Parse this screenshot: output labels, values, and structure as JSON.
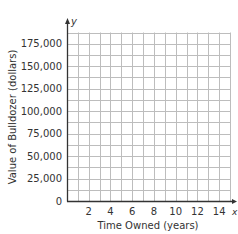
{
  "chart_data": {
    "type": "line",
    "title": "",
    "xlabel": "Time Owned (years)",
    "ylabel": "Value of Bulldozer (dollars)",
    "x_axis_var": "x",
    "y_axis_var": "y",
    "xlim": [
      0,
      15
    ],
    "ylim": [
      0,
      187500
    ],
    "x_ticks": [
      2,
      4,
      6,
      8,
      10,
      12,
      14
    ],
    "x_tick_labels": [
      "2",
      "4",
      "6",
      "8",
      "10",
      "12",
      "14"
    ],
    "y_ticks": [
      0,
      25000,
      50000,
      75000,
      100000,
      125000,
      150000,
      175000
    ],
    "y_tick_labels": [
      "0",
      "25,000",
      "50,000",
      "75,000",
      "100,000",
      "125,000",
      "150,000",
      "175,000"
    ],
    "x_grid_step": 1,
    "y_grid_step": 12500,
    "grid": true,
    "series": [],
    "legend": null
  },
  "colors": {
    "grid": "#bdbdbd",
    "axis": "#333333",
    "text": "#333333",
    "background": "#ffffff"
  }
}
